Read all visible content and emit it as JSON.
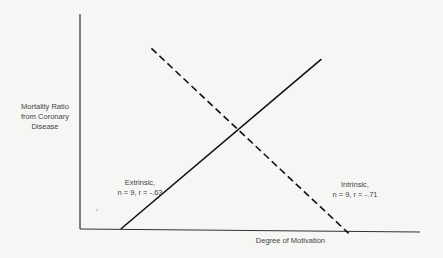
{
  "chart_data": {
    "type": "line",
    "title": "",
    "xlabel": "Degree of Motivation",
    "ylabel": [
      "Mortality Ratio",
      "from Coronary",
      "Disease"
    ],
    "axes": {
      "ticks": false,
      "grid": false,
      "xlim": [
        0,
        1
      ],
      "ylim": [
        0,
        1
      ]
    },
    "series": [
      {
        "name": "Extrinsic",
        "annotation": [
          "Extrinsic,",
          "n = 9, r = -.63"
        ],
        "style": "solid",
        "points": [
          {
            "x": 0.12,
            "y": 0.0
          },
          {
            "x": 0.71,
            "y": 0.79
          }
        ]
      },
      {
        "name": "Intrinsic",
        "annotation": [
          "Intrinsic,",
          "n = 9, r = -.71"
        ],
        "style": "dashed",
        "points": [
          {
            "x": 0.21,
            "y": 0.84
          },
          {
            "x": 0.79,
            "y": -0.02
          }
        ]
      }
    ],
    "intersection": {
      "x": 0.46,
      "y": 0.44
    }
  },
  "colors": {
    "background": "#f6f6f4",
    "ink": "#222222"
  }
}
